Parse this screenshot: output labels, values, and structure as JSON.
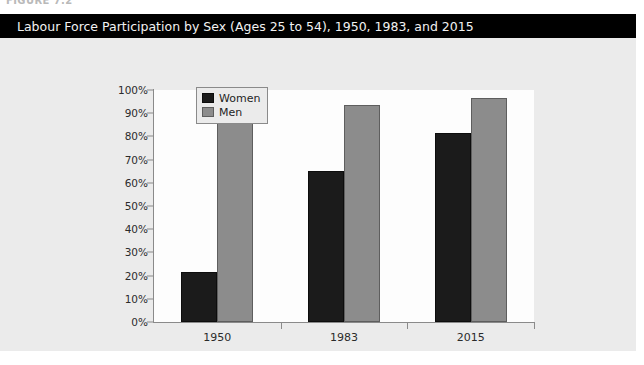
{
  "figure": {
    "caption_clipped": "FIGURE 7.2",
    "title": "Labour Force Participation by Sex (Ages 25 to 54), 1950, 1983, and 2015"
  },
  "colors": {
    "title_bar_bg": "#000000",
    "title_text": "#f2f2f2",
    "panel_bg": "#ebebeb",
    "plot_bg": "#fdfdfd",
    "axis": "#8a8a8a",
    "women": "#1b1b1b",
    "men": "#8c8c8c"
  },
  "legend": {
    "position": "top-left-inside",
    "entries": [
      {
        "label": "Women",
        "color": "#1b1b1b"
      },
      {
        "label": "Men",
        "color": "#8c8c8c"
      }
    ]
  },
  "chart_data": {
    "type": "bar",
    "title": "Labour Force Participation by Sex (Ages 25 to 54), 1950, 1983, and 2015",
    "xlabel": "",
    "ylabel": "",
    "categories": [
      "1950",
      "1983",
      "2015"
    ],
    "series": [
      {
        "name": "Women",
        "values": [
          21.5,
          65.0,
          81.5
        ]
      },
      {
        "name": "Men",
        "values": [
          96.5,
          93.5,
          96.5
        ]
      }
    ],
    "ylim": [
      0,
      100
    ],
    "y_ticks": [
      0,
      10,
      20,
      30,
      40,
      50,
      60,
      70,
      80,
      90,
      100
    ],
    "y_tick_labels": [
      "0%",
      "10%",
      "20%",
      "30%",
      "40%",
      "50%",
      "60%",
      "70%",
      "80%",
      "90%",
      "100%"
    ],
    "grid": false,
    "legend_position": "upper left"
  }
}
